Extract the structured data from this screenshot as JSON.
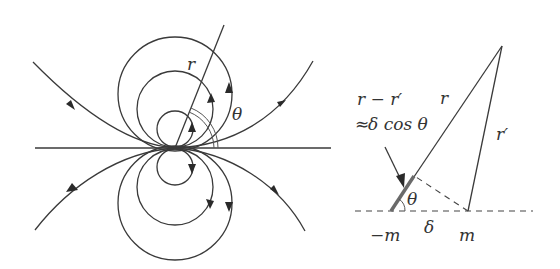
{
  "figure": {
    "left_panel": {
      "title": "dipole field lines",
      "labels": {
        "radius": "r",
        "angle": "θ"
      }
    },
    "right_panel": {
      "title": "dipole geometry",
      "labels": {
        "path_difference": "r − r′",
        "approximation_prefix": "≈",
        "approximation_body": "δ cos θ",
        "r": "r",
        "r_prime": "r′",
        "angle": "θ",
        "negative_charge": "−m",
        "separation": "δ",
        "positive_charge": "m"
      }
    }
  }
}
